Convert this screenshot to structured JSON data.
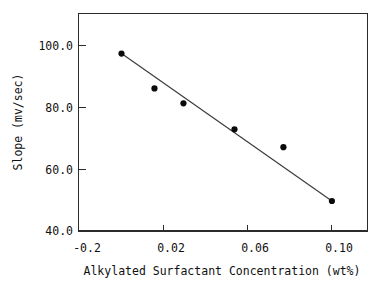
{
  "chart_data": {
    "type": "scatter",
    "title": "",
    "subtitle": "",
    "xlabel": "Alkylated Surfactant Concentration (wt%)",
    "ylabel": "Slope (mv/sec)",
    "xlim": [
      -0.02,
      0.108
    ],
    "ylim": [
      40.0,
      100.7
    ],
    "grid": false,
    "legend": null,
    "x_tick_labels": [
      "-0.2",
      "0.02",
      "0.06",
      "0.10"
    ],
    "x_tick_values": [
      -0.02,
      0.02,
      0.06,
      0.1
    ],
    "y_tick_labels": [
      "100.0",
      "80.0",
      "60.0",
      "40.0"
    ],
    "y_tick_values": [
      100.0,
      80.0,
      60.0,
      40.0
    ],
    "x": [
      0.0,
      0.0157,
      0.0295,
      0.0538,
      0.0771,
      0.1002
    ],
    "y": [
      97.4,
      86.1,
      81.3,
      72.9,
      67.1,
      49.7
    ],
    "points": [
      {
        "x": 0.0,
        "y": 97.4
      },
      {
        "x": 0.0157,
        "y": 86.1
      },
      {
        "x": 0.0295,
        "y": 81.3
      },
      {
        "x": 0.0538,
        "y": 72.9
      },
      {
        "x": 0.0771,
        "y": 67.1
      },
      {
        "x": 0.1002,
        "y": 49.7
      }
    ],
    "series": [
      {
        "name": "slope-vs-concentration",
        "marker": "filled-circle",
        "marker_color": "#0a0a0a",
        "values": [
          97.4,
          86.1,
          81.3,
          72.9,
          67.1,
          49.7
        ]
      }
    ],
    "trendline": {
      "type": "linear-fit",
      "color": "#3a3a3a",
      "x_start": 0.0,
      "y_start": 97.4,
      "x_end": 0.1002,
      "y_end": 49.7
    }
  },
  "axes": {
    "x_title": "Alkylated Surfactant Concentration (wt%)",
    "y_title": "Slope (mv/sec)",
    "x_ticks": [
      {
        "label": "-0.2",
        "value": -0.02
      },
      {
        "label": "0.02",
        "value": 0.02
      },
      {
        "label": "0.06",
        "value": 0.06
      },
      {
        "label": "0.10",
        "value": 0.1
      }
    ],
    "y_ticks": [
      {
        "label": "100.0",
        "value": 100.0
      },
      {
        "label": "80.0",
        "value": 80.0
      },
      {
        "label": "60.0",
        "value": 60.0
      },
      {
        "label": "40.0",
        "value": 40.0
      }
    ]
  },
  "colors": {
    "frame": "#2b2b2b",
    "marker": "#0a0a0a",
    "line": "#3a3a3a",
    "text": "#101010",
    "background": "#ffffff"
  }
}
